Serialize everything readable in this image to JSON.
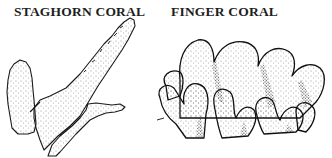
{
  "labels": {
    "staghorn": "STAGHORN CORAL",
    "finger": "FINGER CORAL"
  },
  "illustrations": [
    {
      "name": "staghorn-coral",
      "style": "pen-and-ink stipple"
    },
    {
      "name": "finger-coral",
      "style": "pen-and-ink stipple"
    }
  ],
  "colors": {
    "background": "#ffffff",
    "ink": "#1a1a1a"
  }
}
